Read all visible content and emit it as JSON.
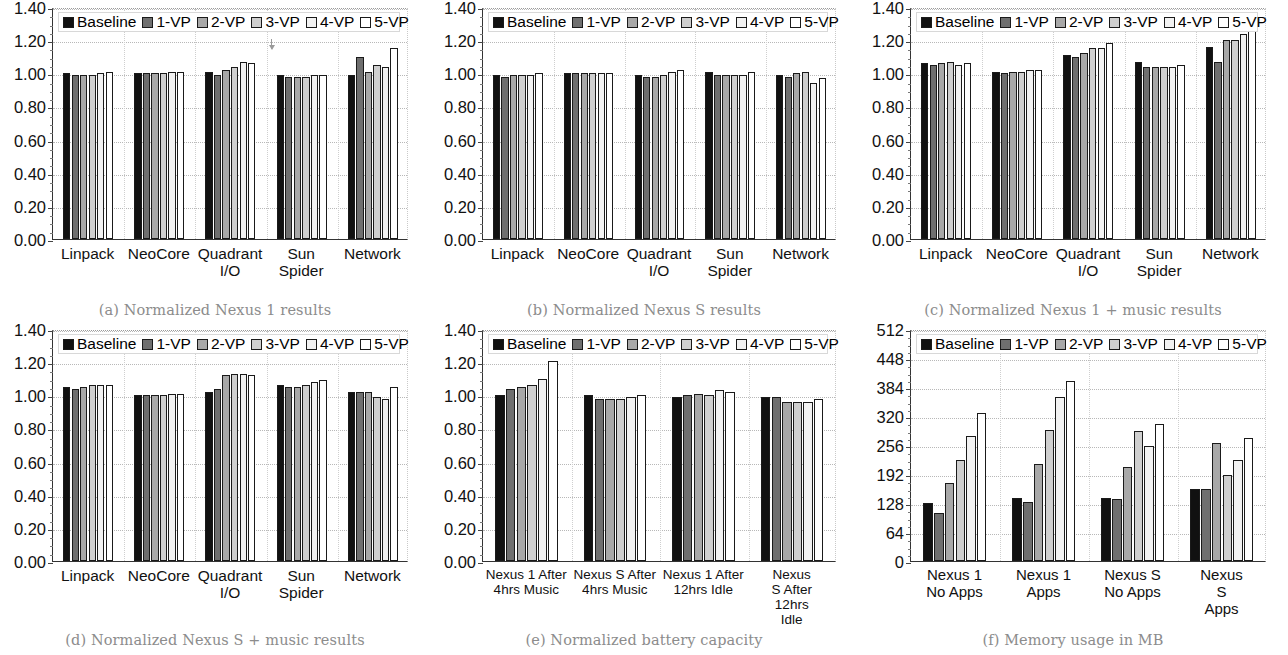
{
  "figure": {
    "series_names": [
      "Baseline",
      "1-VP",
      "2-VP",
      "3-VP",
      "4-VP",
      "5-VP"
    ],
    "series_colors": [
      "#111111",
      "#6f6f6f",
      "#a8a8a8",
      "#cfcfcf",
      "#f2f2f2",
      "#ffffff"
    ]
  },
  "panels": [
    {
      "id": "a",
      "caption": "(a) Normalized Nexus 1 results",
      "chart_data": {
        "type": "bar",
        "title": "Normalized Nexus 1 results",
        "xlabel": "",
        "ylabel": "",
        "ylim": [
          0.0,
          1.4
        ],
        "yticks": [
          "0.00",
          "0.20",
          "0.40",
          "0.60",
          "0.80",
          "1.00",
          "1.20",
          "1.40"
        ],
        "ytick_values": [
          0.0,
          0.2,
          0.4,
          0.6,
          0.8,
          1.0,
          1.2,
          1.4
        ],
        "grid": true,
        "legend": "top-left",
        "categories": [
          "Linpack",
          "NeoCore",
          "Quadrant\nI/O",
          "Sun\nSpider",
          "Network"
        ],
        "series": [
          {
            "name": "Baseline",
            "values": [
              1.0,
              1.0,
              1.01,
              0.99,
              0.99
            ]
          },
          {
            "name": "1-VP",
            "values": [
              0.99,
              1.0,
              0.99,
              0.98,
              1.1
            ]
          },
          {
            "name": "2-VP",
            "values": [
              0.99,
              1.0,
              1.02,
              0.98,
              1.01
            ]
          },
          {
            "name": "3-VP",
            "values": [
              0.99,
              1.0,
              1.04,
              0.98,
              1.05
            ]
          },
          {
            "name": "4-VP",
            "values": [
              1.0,
              1.01,
              1.07,
              0.99,
              1.04
            ]
          },
          {
            "name": "5-VP",
            "values": [
              1.01,
              1.01,
              1.06,
              0.99,
              1.15
            ]
          }
        ],
        "annotations": [
          {
            "type": "arrow",
            "near_category": "Sun\nSpider",
            "y_from": 1.22,
            "y_to": 1.16
          }
        ]
      }
    },
    {
      "id": "b",
      "caption": "(b) Normalized Nexus S results",
      "chart_data": {
        "type": "bar",
        "title": "Normalized Nexus S results",
        "xlabel": "",
        "ylabel": "",
        "ylim": [
          0.0,
          1.4
        ],
        "yticks": [
          "0.00",
          "0.20",
          "0.40",
          "0.60",
          "0.80",
          "1.00",
          "1.20",
          "1.40"
        ],
        "ytick_values": [
          0.0,
          0.2,
          0.4,
          0.6,
          0.8,
          1.0,
          1.2,
          1.4
        ],
        "grid": true,
        "legend": "top-left",
        "categories": [
          "Linpack",
          "NeoCore",
          "Quadrant\nI/O",
          "Sun\nSpider",
          "Network"
        ],
        "series": [
          {
            "name": "Baseline",
            "values": [
              0.99,
              1.0,
              0.99,
              1.01,
              0.99
            ]
          },
          {
            "name": "1-VP",
            "values": [
              0.98,
              1.0,
              0.98,
              0.99,
              0.98
            ]
          },
          {
            "name": "2-VP",
            "values": [
              0.99,
              1.0,
              0.98,
              0.99,
              1.0
            ]
          },
          {
            "name": "3-VP",
            "values": [
              0.99,
              1.0,
              0.99,
              0.99,
              1.01
            ]
          },
          {
            "name": "4-VP",
            "values": [
              0.99,
              1.0,
              1.01,
              0.99,
              0.94
            ]
          },
          {
            "name": "5-VP",
            "values": [
              1.0,
              1.0,
              1.02,
              1.01,
              0.97
            ]
          }
        ]
      }
    },
    {
      "id": "c",
      "caption": "(c) Normalized Nexus 1 + music results",
      "chart_data": {
        "type": "bar",
        "title": "Normalized Nexus 1 + music results",
        "xlabel": "",
        "ylabel": "",
        "ylim": [
          0.0,
          1.4
        ],
        "yticks": [
          "0.00",
          "0.20",
          "0.40",
          "0.60",
          "0.80",
          "1.00",
          "1.20",
          "1.40"
        ],
        "ytick_values": [
          0.0,
          0.2,
          0.4,
          0.6,
          0.8,
          1.0,
          1.2,
          1.4
        ],
        "grid": true,
        "legend": "top-left",
        "categories": [
          "Linpack",
          "NeoCore",
          "Quadrant\nI/O",
          "Sun\nSpider",
          "Network"
        ],
        "series": [
          {
            "name": "Baseline",
            "values": [
              1.06,
              1.01,
              1.11,
              1.07,
              1.16
            ]
          },
          {
            "name": "1-VP",
            "values": [
              1.05,
              1.0,
              1.1,
              1.04,
              1.07
            ]
          },
          {
            "name": "2-VP",
            "values": [
              1.06,
              1.01,
              1.12,
              1.04,
              1.2
            ]
          },
          {
            "name": "3-VP",
            "values": [
              1.07,
              1.01,
              1.15,
              1.04,
              1.2
            ]
          },
          {
            "name": "4-VP",
            "values": [
              1.05,
              1.02,
              1.15,
              1.04,
              1.24
            ]
          },
          {
            "name": "5-VP",
            "values": [
              1.06,
              1.02,
              1.18,
              1.05,
              1.28
            ]
          }
        ]
      }
    },
    {
      "id": "d",
      "caption": "(d) Normalized Nexus S + music results",
      "chart_data": {
        "type": "bar",
        "title": "Normalized Nexus S + music results",
        "xlabel": "",
        "ylabel": "",
        "ylim": [
          0.0,
          1.4
        ],
        "yticks": [
          "0.00",
          "0.20",
          "0.40",
          "0.60",
          "0.80",
          "1.00",
          "1.20",
          "1.40"
        ],
        "ytick_values": [
          0.0,
          0.2,
          0.4,
          0.6,
          0.8,
          1.0,
          1.2,
          1.4
        ],
        "grid": true,
        "legend": "top-left",
        "categories": [
          "Linpack",
          "NeoCore",
          "Quadrant\nI/O",
          "Sun\nSpider",
          "Network"
        ],
        "series": [
          {
            "name": "Baseline",
            "values": [
              1.05,
              1.0,
              1.02,
              1.06,
              1.02
            ]
          },
          {
            "name": "1-VP",
            "values": [
              1.04,
              1.0,
              1.04,
              1.05,
              1.02
            ]
          },
          {
            "name": "2-VP",
            "values": [
              1.05,
              1.0,
              1.12,
              1.05,
              1.02
            ]
          },
          {
            "name": "3-VP",
            "values": [
              1.06,
              1.0,
              1.13,
              1.06,
              0.99
            ]
          },
          {
            "name": "4-VP",
            "values": [
              1.06,
              1.01,
              1.13,
              1.08,
              0.98
            ]
          },
          {
            "name": "5-VP",
            "values": [
              1.06,
              1.01,
              1.12,
              1.09,
              1.05
            ]
          }
        ]
      }
    },
    {
      "id": "e",
      "caption": "(e) Normalized battery capacity",
      "chart_data": {
        "type": "bar",
        "title": "Normalized battery capacity",
        "xlabel": "",
        "ylabel": "",
        "ylim": [
          0.0,
          1.4
        ],
        "yticks": [
          "0.00",
          "0.20",
          "0.40",
          "0.60",
          "0.80",
          "1.00",
          "1.20",
          "1.40"
        ],
        "ytick_values": [
          0.0,
          0.2,
          0.4,
          0.6,
          0.8,
          1.0,
          1.2,
          1.4
        ],
        "grid": true,
        "legend": "top-left",
        "categories": [
          "Nexus 1 After\n4hrs Music",
          "Nexus S After\n4hrs Music",
          "Nexus 1 After\n12hrs Idle",
          "Nexus S After\n12hrs Idle"
        ],
        "series": [
          {
            "name": "Baseline",
            "values": [
              1.0,
              1.0,
              0.99,
              0.99
            ]
          },
          {
            "name": "1-VP",
            "values": [
              1.04,
              0.98,
              1.0,
              0.99
            ]
          },
          {
            "name": "2-VP",
            "values": [
              1.05,
              0.98,
              1.01,
              0.96
            ]
          },
          {
            "name": "3-VP",
            "values": [
              1.06,
              0.98,
              1.0,
              0.96
            ]
          },
          {
            "name": "4-VP",
            "values": [
              1.1,
              0.99,
              1.03,
              0.96
            ]
          },
          {
            "name": "5-VP",
            "values": [
              1.21,
              1.0,
              1.02,
              0.98
            ]
          }
        ]
      }
    },
    {
      "id": "f",
      "caption": "(f) Memory usage in MB",
      "chart_data": {
        "type": "bar",
        "title": "Memory usage in MB",
        "xlabel": "",
        "ylabel": "MB",
        "ylim": [
          0,
          512
        ],
        "yticks": [
          "0",
          "64",
          "128",
          "192",
          "256",
          "320",
          "384",
          "448",
          "512"
        ],
        "ytick_values": [
          0,
          64,
          128,
          192,
          256,
          320,
          384,
          448,
          512
        ],
        "grid": true,
        "legend": "top-left",
        "categories": [
          "Nexus 1\nNo Apps",
          "Nexus 1\nApps",
          "Nexus S\nNo Apps",
          "Nexus S\nApps"
        ],
        "series": [
          {
            "name": "Baseline",
            "values": [
              127,
              140,
              138,
              160
            ]
          },
          {
            "name": "1-VP",
            "values": [
              105,
              130,
              137,
              158
            ]
          },
          {
            "name": "2-VP",
            "values": [
              173,
              213,
              207,
              261
            ]
          },
          {
            "name": "3-VP",
            "values": [
              222,
              289,
              287,
              190
            ]
          },
          {
            "name": "4-VP",
            "values": [
              276,
              361,
              254,
              222
            ]
          },
          {
            "name": "5-VP",
            "values": [
              327,
              397,
              302,
              271
            ]
          }
        ]
      }
    }
  ]
}
